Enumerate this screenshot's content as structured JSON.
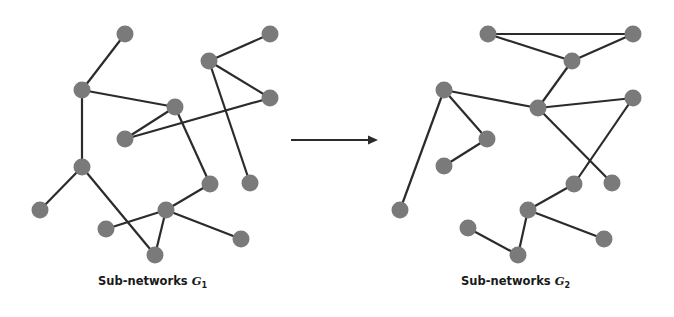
{
  "diagram": {
    "type": "network-transformation",
    "arrow": {
      "from": [
        291,
        140
      ],
      "to": [
        378,
        140
      ],
      "label": ""
    },
    "graphs": [
      {
        "id": "G1",
        "caption": {
          "text": "Sub-networks ",
          "var": "G",
          "sub": "1",
          "x": 98,
          "y": 283
        },
        "nodes": [
          {
            "id": "n1",
            "x": 125,
            "y": 34
          },
          {
            "id": "n2",
            "x": 270,
            "y": 34
          },
          {
            "id": "n3",
            "x": 82,
            "y": 90
          },
          {
            "id": "n4",
            "x": 209,
            "y": 61
          },
          {
            "id": "n5",
            "x": 270,
            "y": 98
          },
          {
            "id": "n6",
            "x": 175,
            "y": 107
          },
          {
            "id": "n7",
            "x": 125,
            "y": 139
          },
          {
            "id": "n8",
            "x": 82,
            "y": 167
          },
          {
            "id": "n9",
            "x": 210,
            "y": 184
          },
          {
            "id": "n10",
            "x": 250,
            "y": 183
          },
          {
            "id": "n11",
            "x": 40,
            "y": 210
          },
          {
            "id": "n12",
            "x": 166,
            "y": 210
          },
          {
            "id": "n13",
            "x": 106,
            "y": 229
          },
          {
            "id": "n14",
            "x": 241,
            "y": 239
          },
          {
            "id": "n15",
            "x": 155,
            "y": 255
          }
        ],
        "edges": [
          [
            "n1",
            "n3"
          ],
          [
            "n3",
            "n6"
          ],
          [
            "n3",
            "n8"
          ],
          [
            "n6",
            "n7"
          ],
          [
            "n7",
            "n5"
          ],
          [
            "n4",
            "n2"
          ],
          [
            "n4",
            "n5"
          ],
          [
            "n4",
            "n10"
          ],
          [
            "n6",
            "n9"
          ],
          [
            "n9",
            "n12"
          ],
          [
            "n8",
            "n11"
          ],
          [
            "n8",
            "n15"
          ],
          [
            "n12",
            "n13"
          ],
          [
            "n12",
            "n15"
          ],
          [
            "n12",
            "n14"
          ]
        ]
      },
      {
        "id": "G2",
        "caption": {
          "text": "Sub-networks ",
          "var": "G",
          "sub": "2",
          "x": 461,
          "y": 283
        },
        "nodes": [
          {
            "id": "a",
            "x": 488,
            "y": 34
          },
          {
            "id": "b",
            "x": 633,
            "y": 34
          },
          {
            "id": "c",
            "x": 572,
            "y": 61
          },
          {
            "id": "d",
            "x": 444,
            "y": 90
          },
          {
            "id": "e",
            "x": 538,
            "y": 108
          },
          {
            "id": "f",
            "x": 633,
            "y": 98
          },
          {
            "id": "g",
            "x": 487,
            "y": 139
          },
          {
            "id": "h",
            "x": 444,
            "y": 166
          },
          {
            "id": "i",
            "x": 574,
            "y": 184
          },
          {
            "id": "j",
            "x": 612,
            "y": 183
          },
          {
            "id": "k",
            "x": 400,
            "y": 210
          },
          {
            "id": "l",
            "x": 528,
            "y": 210
          },
          {
            "id": "m",
            "x": 468,
            "y": 228
          },
          {
            "id": "n",
            "x": 604,
            "y": 239
          },
          {
            "id": "o",
            "x": 518,
            "y": 255
          }
        ],
        "edges": [
          [
            "a",
            "b"
          ],
          [
            "a",
            "c"
          ],
          [
            "b",
            "c"
          ],
          [
            "c",
            "e"
          ],
          [
            "d",
            "e"
          ],
          [
            "e",
            "f"
          ],
          [
            "d",
            "k"
          ],
          [
            "d",
            "g"
          ],
          [
            "g",
            "h"
          ],
          [
            "e",
            "j"
          ],
          [
            "f",
            "i"
          ],
          [
            "i",
            "l"
          ],
          [
            "l",
            "o"
          ],
          [
            "m",
            "o"
          ],
          [
            "l",
            "n"
          ]
        ]
      }
    ],
    "style": {
      "node_color": "#7a7a7a",
      "edge_color": "#2b2b2b",
      "node_radius": 8.5
    }
  }
}
